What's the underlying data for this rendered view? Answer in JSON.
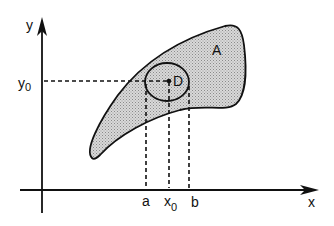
{
  "diagram": {
    "colors": {
      "stroke": "#111111",
      "region_fill": "#cfcfcf",
      "background": "#ffffff"
    },
    "axes": {
      "x_label": "x",
      "y_label": "y"
    },
    "region_A": {
      "label": "A"
    },
    "region_D": {
      "label": "D"
    },
    "marks": {
      "y0_base": "y",
      "y0_sub": "0",
      "x0_base": "x",
      "x0_sub": "0",
      "a": "a",
      "b": "b"
    }
  }
}
